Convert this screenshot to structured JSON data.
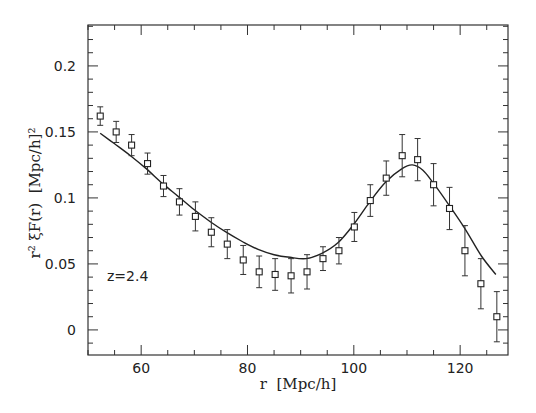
{
  "chart_data": {
    "type": "scatter",
    "title": "",
    "xlabel": "r  [Mpc/h]",
    "ylabel": "r² ξF(r)  [Mpc/h]²",
    "xlim": [
      50,
      129
    ],
    "ylim": [
      -0.019,
      0.231
    ],
    "x_ticks": [
      60,
      80,
      100,
      120
    ],
    "x_tick_labels": [
      "60",
      "80",
      "100",
      "120"
    ],
    "y_ticks": [
      0,
      0.05,
      0.1,
      0.15,
      0.2
    ],
    "y_tick_labels": [
      "0",
      "0.05",
      "0.1",
      "0.15",
      "0.2"
    ],
    "grid": false,
    "legend": null,
    "annotations": [
      {
        "text": "z=2.4",
        "x": 53.5,
        "y": 0.041
      }
    ],
    "series": [
      {
        "name": "data",
        "style": "open-square-markers-with-errorbars",
        "x": [
          52.3,
          55.3,
          58.2,
          61.2,
          64.2,
          67.2,
          70.2,
          73.2,
          76.2,
          79.2,
          82.2,
          85.2,
          88.2,
          91.2,
          94.2,
          97.2,
          100.1,
          103.1,
          106.1,
          109.1,
          112.0,
          115.0,
          118.0,
          120.9,
          123.9,
          126.9
        ],
        "y": [
          0.162,
          0.15,
          0.14,
          0.126,
          0.109,
          0.097,
          0.086,
          0.074,
          0.065,
          0.053,
          0.044,
          0.042,
          0.041,
          0.044,
          0.054,
          0.06,
          0.078,
          0.098,
          0.115,
          0.132,
          0.129,
          0.11,
          0.092,
          0.06,
          0.035,
          0.01
        ],
        "yerr": [
          0.007,
          0.008,
          0.008,
          0.008,
          0.008,
          0.01,
          0.011,
          0.011,
          0.011,
          0.011,
          0.012,
          0.012,
          0.013,
          0.013,
          0.009,
          0.01,
          0.011,
          0.012,
          0.013,
          0.016,
          0.016,
          0.016,
          0.016,
          0.019,
          0.019,
          0.019
        ]
      },
      {
        "name": "model",
        "style": "solid-line",
        "x": [
          52.3,
          55,
          58,
          61,
          64,
          67,
          70,
          73,
          76,
          79,
          82,
          85,
          88,
          91,
          94,
          97,
          100,
          103,
          106,
          109,
          111,
          113,
          115,
          118,
          121,
          124,
          126.7
        ],
        "y": [
          0.149,
          0.141,
          0.132,
          0.122,
          0.111,
          0.101,
          0.091,
          0.082,
          0.074,
          0.067,
          0.061,
          0.057,
          0.055,
          0.054,
          0.058,
          0.066,
          0.08,
          0.097,
          0.112,
          0.122,
          0.125,
          0.121,
          0.111,
          0.094,
          0.076,
          0.056,
          0.042
        ]
      }
    ]
  }
}
